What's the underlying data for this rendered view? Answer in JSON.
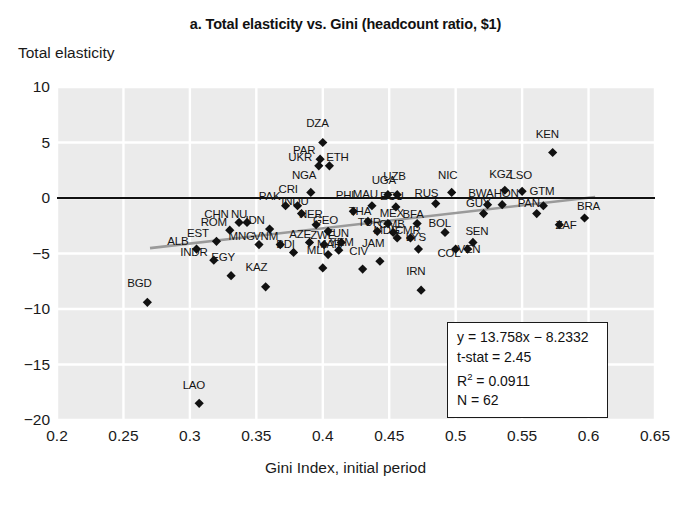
{
  "chart_data": {
    "type": "scatter",
    "title": "a. Total elasticity vs. Gini (headcount ratio, $1)",
    "xlabel": "Gini Index, initial period",
    "ylabel": "Total elasticity",
    "xlim": [
      0.2,
      0.65
    ],
    "ylim": [
      -20,
      10
    ],
    "xticks": [
      "0.2",
      "0.25",
      "0.3",
      "0.35",
      "0.4",
      "0.45",
      "0.5",
      "0.55",
      "0.6",
      "0.65"
    ],
    "xtick_values": [
      0.2,
      0.25,
      0.3,
      0.35,
      0.4,
      0.45,
      0.5,
      0.55,
      0.6,
      0.65
    ],
    "yticks": [
      "10",
      "5",
      "0",
      "−5",
      "−10",
      "−15",
      "−20"
    ],
    "ytick_values": [
      10,
      5,
      0,
      -5,
      -10,
      -15,
      -20
    ],
    "grid": true,
    "legend": "none",
    "marker": "diamond",
    "marker_color": "#111111",
    "plot_background": "#ebebeb",
    "gridline_color": "#ffffff",
    "zero_line": {
      "y": 0,
      "color": "#111111"
    },
    "trend_line": {
      "slope": 13.758,
      "intercept": -8.2332,
      "color": "#9a9a9a",
      "x_start": 0.27,
      "x_end": 0.605
    },
    "annotations": {
      "equation": "y = 13.758x − 8.2332",
      "t_stat": "t-stat = 2.45",
      "r_squared_label": "R",
      "r_squared_exp": "2",
      "r_squared_value": " = 0.0911",
      "n": "N = 62"
    },
    "points": [
      {
        "label": "BGD",
        "x": 0.268,
        "y": -9.4,
        "lx": 0.262,
        "ly": -8.1
      },
      {
        "label": "ALB",
        "x": 0.305,
        "y": -4.6,
        "lx": 0.291,
        "ly": -4.3
      },
      {
        "label": "INDR",
        "x": 0.318,
        "y": -5.6,
        "lx": 0.303,
        "ly": -5.3
      },
      {
        "label": "EST",
        "x": 0.32,
        "y": -3.9,
        "lx": 0.306,
        "ly": -3.6
      },
      {
        "label": "ROM",
        "x": 0.33,
        "y": -2.9,
        "lx": 0.318,
        "ly": -2.6
      },
      {
        "label": "CHN",
        "x": 0.337,
        "y": -2.2,
        "lx": 0.32,
        "ly": -1.9
      },
      {
        "label": "NU",
        "x": 0.343,
        "y": -2.2,
        "lx": 0.337,
        "ly": -1.9
      },
      {
        "label": "LAO",
        "x": 0.307,
        "y": -18.5,
        "lx": 0.303,
        "ly": -17.3
      },
      {
        "label": "EGY",
        "x": 0.331,
        "y": -7.0,
        "lx": 0.325,
        "ly": -5.8
      },
      {
        "label": "MNG",
        "x": 0.352,
        "y": -4.2,
        "lx": 0.339,
        "ly": -3.9
      },
      {
        "label": "IDN",
        "x": 0.36,
        "y": -2.8,
        "lx": 0.349,
        "ly": -2.4
      },
      {
        "label": "KAZ",
        "x": 0.357,
        "y": -8.0,
        "lx": 0.35,
        "ly": -6.7
      },
      {
        "label": "VNM",
        "x": 0.368,
        "y": -4.2,
        "lx": 0.357,
        "ly": -3.9
      },
      {
        "label": "PAK",
        "x": 0.372,
        "y": -0.7,
        "lx": 0.36,
        "ly": -0.3
      },
      {
        "label": "CRI",
        "x": 0.381,
        "y": -0.7,
        "lx": 0.374,
        "ly": 0.4
      },
      {
        "label": "INDU",
        "x": 0.384,
        "y": -1.4,
        "lx": 0.379,
        "ly": -0.7
      },
      {
        "label": "NER",
        "x": 0.395,
        "y": -2.4,
        "lx": 0.391,
        "ly": -1.9
      },
      {
        "label": "AZE",
        "x": 0.39,
        "y": -4.0,
        "lx": 0.383,
        "ly": -3.7
      },
      {
        "label": "GEO",
        "x": 0.404,
        "y": -3.0,
        "lx": 0.402,
        "ly": -2.4
      },
      {
        "label": "ZWE",
        "x": 0.401,
        "y": -4.2,
        "lx": 0.4,
        "ly": -3.8
      },
      {
        "label": "BDI",
        "x": 0.378,
        "y": -4.9,
        "lx": 0.372,
        "ly": -4.6
      },
      {
        "label": "MLI",
        "x": 0.4,
        "y": -6.3,
        "lx": 0.395,
        "ly": -5.1
      },
      {
        "label": "MAR",
        "x": 0.404,
        "y": -5.1,
        "lx": 0.405,
        "ly": -4.6
      },
      {
        "label": "YEM",
        "x": 0.412,
        "y": -4.7,
        "lx": 0.414,
        "ly": -4.4
      },
      {
        "label": "TUN",
        "x": 0.414,
        "y": -4.0,
        "lx": 0.411,
        "ly": -3.6
      },
      {
        "label": "NGA",
        "x": 0.391,
        "y": 0.5,
        "lx": 0.386,
        "ly": 1.6
      },
      {
        "label": "DZA",
        "x": 0.4,
        "y": 5.0,
        "lx": 0.396,
        "ly": 6.3
      },
      {
        "label": "PAR",
        "x": 0.398,
        "y": 3.5,
        "lx": 0.386,
        "ly": 3.9
      },
      {
        "label": "UKR",
        "x": 0.397,
        "y": 2.9,
        "lx": 0.383,
        "ly": 3.2
      },
      {
        "label": "ETH",
        "x": 0.405,
        "y": 2.9,
        "lx": 0.411,
        "ly": 3.2
      },
      {
        "label": "PHL",
        "x": 0.423,
        "y": -1.2,
        "lx": 0.418,
        "ly": -0.2
      },
      {
        "label": "CIV",
        "x": 0.43,
        "y": -6.4,
        "lx": 0.427,
        "ly": -5.2
      },
      {
        "label": "JAM",
        "x": 0.443,
        "y": -5.7,
        "lx": 0.438,
        "ly": -4.5
      },
      {
        "label": "THA",
        "x": 0.434,
        "y": -2.1,
        "lx": 0.428,
        "ly": -1.6
      },
      {
        "label": "MAU",
        "x": 0.437,
        "y": -0.7,
        "lx": 0.432,
        "ly": -0.1
      },
      {
        "label": "TUR",
        "x": 0.441,
        "y": -3.0,
        "lx": 0.435,
        "ly": -2.6
      },
      {
        "label": "UGA",
        "x": 0.449,
        "y": 0.3,
        "lx": 0.446,
        "ly": 1.2
      },
      {
        "label": "UZB",
        "x": 0.456,
        "y": 0.3,
        "lx": 0.454,
        "ly": 1.5
      },
      {
        "label": "ECU",
        "x": 0.455,
        "y": -0.8,
        "lx": 0.452,
        "ly": -0.3
      },
      {
        "label": "MEX",
        "x": 0.449,
        "y": -2.3,
        "lx": 0.452,
        "ly": -1.8
      },
      {
        "label": "GMB",
        "x": 0.453,
        "y": -3.1,
        "lx": 0.452,
        "ly": -2.8
      },
      {
        "label": "MDG",
        "x": 0.456,
        "y": -3.6,
        "lx": 0.448,
        "ly": -3.3
      },
      {
        "label": "CMR",
        "x": 0.466,
        "y": -3.6,
        "lx": 0.464,
        "ly": -3.3
      },
      {
        "label": "BFA",
        "x": 0.471,
        "y": -2.3,
        "lx": 0.468,
        "ly": -1.9
      },
      {
        "label": "LYS",
        "x": 0.472,
        "y": -4.6,
        "lx": 0.47,
        "ly": -4.0
      },
      {
        "label": "IRN",
        "x": 0.474,
        "y": -8.3,
        "lx": 0.47,
        "ly": -7.0
      },
      {
        "label": "RUS",
        "x": 0.485,
        "y": -0.5,
        "lx": 0.478,
        "ly": 0.0
      },
      {
        "label": "NIC",
        "x": 0.497,
        "y": 0.5,
        "lx": 0.494,
        "ly": 1.6
      },
      {
        "label": "BOL",
        "x": 0.492,
        "y": -3.1,
        "lx": 0.488,
        "ly": -2.7
      },
      {
        "label": "COL",
        "x": 0.5,
        "y": -4.6,
        "lx": 0.495,
        "ly": -5.4
      },
      {
        "label": "VEN",
        "x": 0.509,
        "y": -4.6,
        "lx": 0.51,
        "ly": -5.0
      },
      {
        "label": "SEN",
        "x": 0.513,
        "y": -4.0,
        "lx": 0.516,
        "ly": -3.4
      },
      {
        "label": "GUY",
        "x": 0.521,
        "y": -1.4,
        "lx": 0.517,
        "ly": -0.9
      },
      {
        "label": "BWA",
        "x": 0.524,
        "y": -0.6,
        "lx": 0.519,
        "ly": 0.0
      },
      {
        "label": "HON",
        "x": 0.535,
        "y": -0.6,
        "lx": 0.538,
        "ly": 0.0
      },
      {
        "label": "KGZ",
        "x": 0.537,
        "y": 0.7,
        "lx": 0.534,
        "ly": 1.7
      },
      {
        "label": "LSO",
        "x": 0.55,
        "y": 0.6,
        "lx": 0.549,
        "ly": 1.6
      },
      {
        "label": "KEN",
        "x": 0.573,
        "y": 4.1,
        "lx": 0.569,
        "ly": 5.3
      },
      {
        "label": "PAN",
        "x": 0.561,
        "y": -1.4,
        "lx": 0.555,
        "ly": -0.9
      },
      {
        "label": "GTM",
        "x": 0.566,
        "y": -0.7,
        "lx": 0.565,
        "ly": 0.2
      },
      {
        "label": "ZAF",
        "x": 0.578,
        "y": -2.4,
        "lx": 0.583,
        "ly": -2.9
      },
      {
        "label": "BRA",
        "x": 0.597,
        "y": -1.8,
        "lx": 0.6,
        "ly": -1.2
      }
    ]
  }
}
